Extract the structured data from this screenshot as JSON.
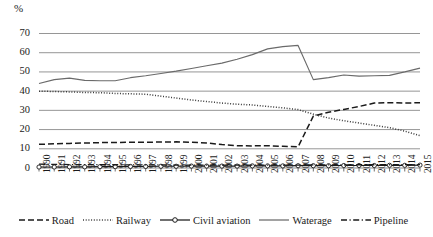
{
  "chart_data": {
    "type": "line",
    "title": "",
    "subtitle": "",
    "xlabel": "",
    "ylabel": "",
    "unit_label": "%",
    "ylim": [
      0,
      70
    ],
    "ytick_values": [
      0,
      10,
      20,
      30,
      40,
      50,
      60,
      70
    ],
    "ytick_labels": [
      "0",
      "10",
      "20",
      "30",
      "40",
      "50",
      "60",
      "70"
    ],
    "grid": true,
    "grid_axis": "y",
    "legend_position": "bottom",
    "categories": [
      "1990",
      "1991",
      "1992",
      "1993",
      "1994",
      "1995",
      "1996",
      "1997",
      "1998",
      "1999",
      "2000",
      "2001",
      "2002",
      "2003",
      "2004",
      "2005",
      "2006",
      "2007",
      "2008",
      "2009",
      "2010",
      "2011",
      "2012",
      "2013",
      "2014",
      "2015"
    ],
    "x": [
      1990,
      1991,
      1992,
      1993,
      1994,
      1995,
      1996,
      1997,
      1998,
      1999,
      2000,
      2001,
      2002,
      2003,
      2004,
      2005,
      2006,
      2007,
      2008,
      2009,
      2010,
      2011,
      2012,
      2013,
      2014,
      2015
    ],
    "series": [
      {
        "name": "Road",
        "style": "dashed",
        "marker": "none",
        "color": "#1a1a1a",
        "values": [
          12.3,
          12.6,
          12.8,
          13.0,
          13.2,
          13.3,
          13.4,
          13.4,
          13.5,
          13.6,
          13.4,
          13.0,
          12.2,
          11.6,
          11.5,
          11.6,
          11.3,
          11.0,
          27.0,
          29.0,
          30.5,
          32.0,
          33.8,
          34.0,
          33.8,
          34.0
        ]
      },
      {
        "name": "Railway",
        "style": "dotted",
        "marker": "none",
        "color": "#3a3a3a",
        "values": [
          40.0,
          39.8,
          39.6,
          39.3,
          39.2,
          38.8,
          38.6,
          38.4,
          37.4,
          36.4,
          35.4,
          34.6,
          33.8,
          33.2,
          32.8,
          32.0,
          31.3,
          30.4,
          28.0,
          26.0,
          24.6,
          23.4,
          22.2,
          21.0,
          19.2,
          16.8
        ]
      },
      {
        "name": "Civil aviation",
        "style": "solid",
        "marker": "circle",
        "color": "#1a1a1a",
        "values": [
          0.5,
          0.5,
          0.6,
          0.6,
          0.7,
          0.7,
          0.8,
          0.8,
          0.9,
          0.9,
          1.0,
          1.0,
          1.0,
          1.0,
          1.1,
          1.1,
          1.1,
          1.2,
          1.2,
          1.2,
          1.3,
          1.3,
          1.3,
          1.4,
          1.4,
          1.5
        ]
      },
      {
        "name": "Waterage",
        "style": "solid",
        "marker": "none",
        "color": "#6a6a6a",
        "values": [
          44.0,
          46.0,
          46.8,
          45.6,
          45.4,
          45.4,
          47.0,
          48.0,
          49.2,
          50.4,
          51.8,
          53.2,
          54.6,
          56.6,
          59.0,
          62.0,
          63.2,
          63.8,
          46.0,
          47.0,
          48.4,
          47.8,
          48.0,
          48.2,
          50.0,
          52.0
        ]
      },
      {
        "name": "Pipeline",
        "style": "dashdot",
        "marker": "none",
        "color": "#1a1a1a",
        "values": [
          2.0,
          1.9,
          1.8,
          1.8,
          1.7,
          1.7,
          1.6,
          1.6,
          1.6,
          1.5,
          1.5,
          1.5,
          1.5,
          1.5,
          1.5,
          1.5,
          1.5,
          1.5,
          1.6,
          1.6,
          1.6,
          1.7,
          1.7,
          1.7,
          1.8,
          1.8
        ]
      }
    ]
  },
  "legend": {
    "items": [
      {
        "label": "Road",
        "key": "dashed-line-key"
      },
      {
        "label": "Railway",
        "key": "dotted-line-key"
      },
      {
        "label": "Civil aviation",
        "key": "solid-circle-line-key"
      },
      {
        "label": "Waterage",
        "key": "solid-line-key"
      },
      {
        "label": "Pipeline",
        "key": "dashdot-line-key"
      }
    ]
  }
}
